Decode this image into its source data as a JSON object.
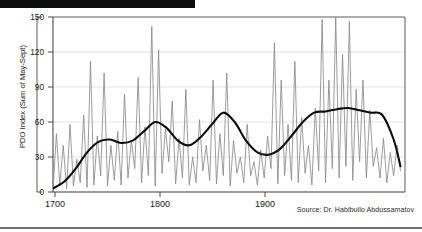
{
  "figure": {
    "source_note": "Source: Dr. Habibullo Abdussamatov",
    "decor": {
      "top_black_bar": "black-bar",
      "bottom_rule": "bottom-rule"
    }
  },
  "colors": {
    "annual_line": "#8a8a8a",
    "trend_line": "#0d0d0d",
    "gridline": "#e3e3e3",
    "axis": "#4a4a4a",
    "plot_border": "#5a5a5a",
    "background": "#ffffff",
    "text": "#1a1a1a"
  },
  "chart_data": {
    "type": "line",
    "title": "",
    "xlabel": "",
    "ylabel": "PDO Index (Sum of May-Sept)",
    "xlim": [
      1695,
      2005
    ],
    "ylim": [
      0,
      150
    ],
    "xticks": [
      1700,
      1800,
      1900
    ],
    "xtick_labels": [
      "1700",
      "1800",
      "1900"
    ],
    "yticks": [
      0,
      30,
      60,
      90,
      120,
      150
    ],
    "ytick_labels": [
      "0",
      "30",
      "60",
      "90",
      "120",
      "150"
    ],
    "grid": "horizontal",
    "legend": "none",
    "series": [
      {
        "name": "Annual PDO Index",
        "style": "thin-gray",
        "x": [
          1695,
          1698,
          1701,
          1704,
          1707,
          1710,
          1713,
          1716,
          1719,
          1722,
          1725,
          1728,
          1731,
          1734,
          1737,
          1740,
          1743,
          1746,
          1749,
          1752,
          1755,
          1758,
          1761,
          1764,
          1767,
          1770,
          1773,
          1776,
          1779,
          1782,
          1785,
          1788,
          1791,
          1794,
          1797,
          1800,
          1803,
          1806,
          1809,
          1812,
          1815,
          1818,
          1821,
          1824,
          1827,
          1830,
          1833,
          1836,
          1839,
          1842,
          1845,
          1848,
          1851,
          1854,
          1857,
          1860,
          1863,
          1866,
          1869,
          1872,
          1875,
          1878,
          1881,
          1884,
          1887,
          1890,
          1893,
          1896,
          1899,
          1902,
          1905,
          1908,
          1911,
          1914,
          1917,
          1920,
          1923,
          1926,
          1929,
          1932,
          1935,
          1938,
          1941,
          1944,
          1947,
          1950,
          1953,
          1956,
          1959,
          1962,
          1965,
          1968,
          1971,
          1974,
          1977,
          1980,
          1983,
          1986,
          1989,
          1992,
          1995,
          1998,
          2001
        ],
        "y": [
          2,
          50,
          6,
          40,
          3,
          58,
          5,
          28,
          8,
          66,
          4,
          112,
          6,
          48,
          14,
          102,
          5,
          40,
          10,
          52,
          6,
          84,
          12,
          44,
          20,
          98,
          8,
          56,
          14,
          142,
          5,
          122,
          16,
          54,
          26,
          78,
          7,
          46,
          12,
          88,
          6,
          30,
          8,
          62,
          18,
          40,
          10,
          96,
          7,
          50,
          14,
          102,
          5,
          44,
          16,
          30,
          8,
          58,
          14,
          26,
          6,
          36,
          12,
          48,
          20,
          128,
          7,
          96,
          14,
          58,
          10,
          112,
          8,
          64,
          16,
          40,
          6,
          72,
          18,
          148,
          8,
          96,
          20,
          150,
          12,
          118,
          22,
          146,
          10,
          88,
          26,
          96,
          12,
          70,
          22,
          38,
          12,
          46,
          8,
          34,
          14,
          40,
          18
        ]
      },
      {
        "name": "Smoothed trend (long-term)",
        "style": "thick-black",
        "x": [
          1695,
          1705,
          1715,
          1725,
          1735,
          1745,
          1755,
          1765,
          1775,
          1785,
          1795,
          1805,
          1815,
          1825,
          1835,
          1845,
          1855,
          1865,
          1875,
          1885,
          1895,
          1905,
          1915,
          1925,
          1935,
          1945,
          1955,
          1965,
          1975,
          1985,
          1995,
          2001
        ],
        "y": [
          3,
          9,
          20,
          34,
          43,
          45,
          42,
          44,
          52,
          60,
          55,
          44,
          40,
          47,
          58,
          68,
          60,
          44,
          34,
          32,
          37,
          48,
          60,
          68,
          69,
          71,
          72,
          70,
          68,
          66,
          45,
          22
        ]
      }
    ]
  }
}
